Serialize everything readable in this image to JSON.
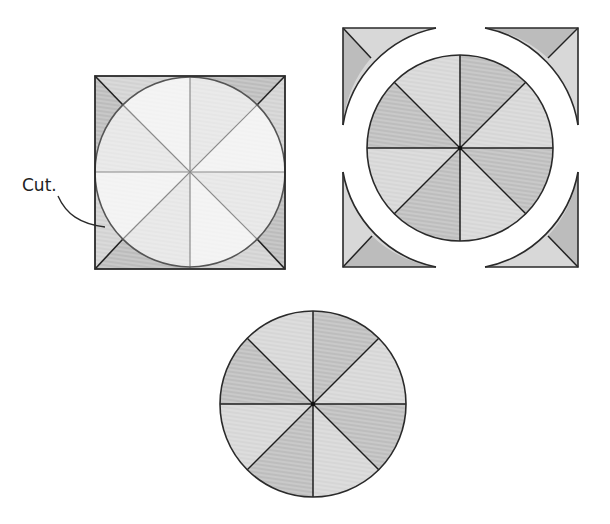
{
  "diagram": {
    "type": "cutting-square-into-circle-sequence",
    "annotation": {
      "label": "Cut."
    },
    "colors": {
      "light": "#ececec",
      "lighter": "#f4f4f4",
      "mid": "#cfcfcf",
      "dark": "#b2b2b2",
      "stroke": "#2a2a2a",
      "guide": "#8a8a8a"
    },
    "panels": [
      {
        "id": "square-with-inscribed-circle",
        "description": "Square divided into 8 wedges with inscribed circle; circle marked as cut line"
      },
      {
        "id": "circle-separated-from-corners",
        "description": "Circle removed from square, four corner pieces pulled apart"
      },
      {
        "id": "final-circle",
        "description": "Resulting circle with 8 alternating-shade wedges"
      }
    ]
  }
}
